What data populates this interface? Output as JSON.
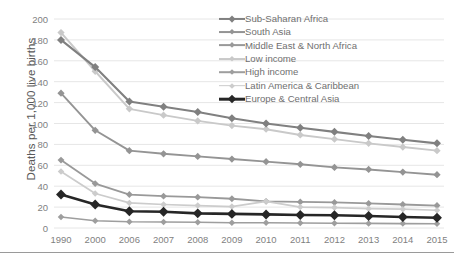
{
  "chart_data": {
    "type": "line",
    "title": "",
    "xlabel": "",
    "ylabel": "Deaths per 1,000 live births",
    "categories": [
      "1990",
      "2000",
      "2006",
      "2007",
      "2008",
      "2009",
      "2010",
      "2011",
      "2012",
      "2013",
      "2014",
      "2015"
    ],
    "ylim": [
      0,
      200
    ],
    "ytick_step": 20,
    "yticks": [
      "200",
      "180",
      "160",
      "140",
      "120",
      "100",
      "80",
      "60",
      "40",
      "20",
      "0"
    ],
    "grid": "horizontal",
    "legend_position": "top-right",
    "series": [
      {
        "name": "Sub-Saharan Africa",
        "color": "#808080",
        "width": 2.1,
        "values": [
          180,
          154,
          121,
          116,
          111,
          105,
          100,
          96,
          92,
          88,
          84.5,
          81
        ]
      },
      {
        "name": "South Asia",
        "color": "#949494",
        "width": 1.9,
        "values": [
          129,
          93.5,
          74,
          71,
          68.5,
          66,
          63.5,
          61,
          58,
          56,
          53.5,
          51
        ]
      },
      {
        "name": "Middle East & North Africa",
        "color": "#999999",
        "width": 1.8,
        "values": [
          65,
          42.5,
          32,
          30.5,
          29.5,
          28,
          25.5,
          25,
          24.5,
          23.5,
          22.5,
          21.5
        ]
      },
      {
        "name": "Low income",
        "color": "#c9c9c9",
        "width": 1.9,
        "values": [
          187,
          150,
          114,
          108,
          102.5,
          98,
          94.5,
          89,
          85,
          81,
          77.5,
          74
        ]
      },
      {
        "name": "High income",
        "color": "#9e9e9e",
        "width": 1.6,
        "values": [
          10.5,
          7,
          6,
          5.8,
          5.5,
          5,
          5,
          4.8,
          4.6,
          4.4,
          4.2,
          4
        ]
      },
      {
        "name": "Latin America & Caribbean",
        "color": "#cccccc",
        "width": 1.7,
        "values": [
          54,
          33,
          24,
          22.5,
          21.5,
          20.5,
          25.5,
          20,
          19.5,
          18.5,
          18,
          17
        ]
      },
      {
        "name": "Europe & Central Asia",
        "color": "#262626",
        "width": 2.6,
        "values": [
          32,
          22.5,
          16,
          15.5,
          14,
          13.5,
          13,
          12.5,
          12.2,
          11.5,
          10.5,
          9.8
        ]
      }
    ]
  },
  "axis": {
    "gridline_color": "#e6e6e6",
    "tick_text_color": "#7f7f7f",
    "ylabel_text_color": "#595959"
  }
}
